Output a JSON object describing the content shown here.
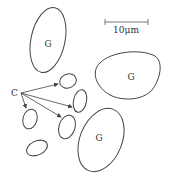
{
  "diagram": {
    "scale_bar": {
      "label": "10μm",
      "x1": 105,
      "x2": 148,
      "y": 22
    },
    "cells_G": [
      {
        "label": "G",
        "cx": 48,
        "cy": 40,
        "rx": 17,
        "ry": 32,
        "rotate": 12
      },
      {
        "label": "G",
        "cx": 127,
        "cy": 77
      },
      {
        "label": "G",
        "cx": 101,
        "cy": 138,
        "rx": 21,
        "ry": 32,
        "rotate": 22
      }
    ],
    "label_C": {
      "text": "C",
      "x": 14,
      "y": 92
    },
    "cells_C": [
      {
        "cx": 68,
        "cy": 81,
        "rx": 8,
        "ry": 7,
        "rotate": -20
      },
      {
        "cx": 80,
        "cy": 101,
        "rx": 7,
        "ry": 11,
        "rotate": 10
      },
      {
        "cx": 30,
        "cy": 118,
        "rx": 7,
        "ry": 10,
        "rotate": 15
      },
      {
        "cx": 67,
        "cy": 127,
        "rx": 8,
        "ry": 12,
        "rotate": 15
      },
      {
        "cx": 37,
        "cy": 148,
        "rx": 11,
        "ry": 7,
        "rotate": -25
      }
    ],
    "stroke_color": "#444444"
  }
}
